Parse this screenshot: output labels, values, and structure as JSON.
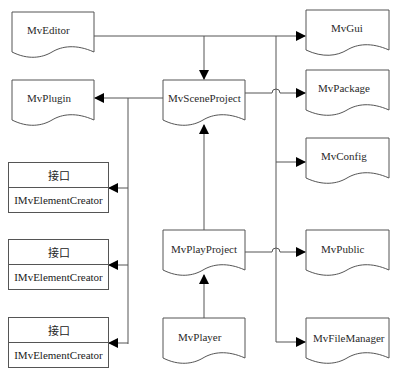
{
  "diagram": {
    "type": "module-dependency",
    "modules": [
      {
        "id": "editor",
        "label": "MvEditor"
      },
      {
        "id": "gui",
        "label": "MvGui"
      },
      {
        "id": "plugin",
        "label": "MvPlugin"
      },
      {
        "id": "scene",
        "label": "MvSceneProject"
      },
      {
        "id": "package",
        "label": "MvPackage"
      },
      {
        "id": "config",
        "label": "MvConfig"
      },
      {
        "id": "play",
        "label": "MvPlayProject"
      },
      {
        "id": "public",
        "label": "MvPublic"
      },
      {
        "id": "player",
        "label": "MvPlayer"
      },
      {
        "id": "filemanager",
        "label": "MvFileManager"
      }
    ],
    "interfaces": [
      {
        "stereotype": "接口",
        "name": "IMvElementCreator"
      },
      {
        "stereotype": "接口",
        "name": "IMvElementCreator"
      },
      {
        "stereotype": "接口",
        "name": "IMvElementCreator"
      }
    ],
    "edges": [
      {
        "from": "MvEditor",
        "to": "MvSceneProject"
      },
      {
        "from": "MvEditor",
        "to": "MvGui"
      },
      {
        "from": "MvSceneProject",
        "to": "MvPlugin"
      },
      {
        "from": "MvSceneProject",
        "to": "MvPackage"
      },
      {
        "from": "MvSceneProject",
        "to": "IMvElementCreator"
      },
      {
        "from": "MvSceneProject",
        "to": "MvConfig"
      },
      {
        "from": "MvSceneProject",
        "to": "MvPublic"
      },
      {
        "from": "MvSceneProject",
        "to": "MvFileManager"
      },
      {
        "from": "MvPlayProject",
        "to": "MvSceneProject"
      },
      {
        "from": "MvPlayProject",
        "to": "MvPublic"
      },
      {
        "from": "MvPlayer",
        "to": "MvPlayProject"
      }
    ],
    "colors": {
      "stroke": "#555555",
      "arrow": "#000000",
      "background": "#ffffff"
    }
  }
}
